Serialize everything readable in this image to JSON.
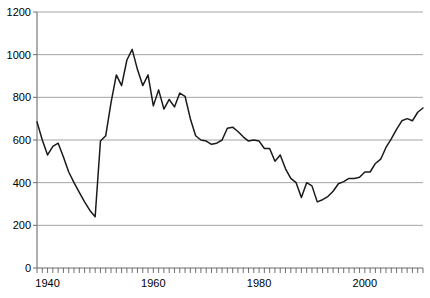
{
  "chart_data": {
    "type": "line",
    "title": "",
    "subtitle": "",
    "xlabel": "",
    "ylabel": "",
    "xlim": [
      1938,
      2011
    ],
    "ylim": [
      0,
      1200
    ],
    "grid": "horizontal",
    "legend": "none",
    "y_ticks": [
      0,
      200,
      400,
      600,
      800,
      1000,
      1200
    ],
    "y_tick_labels": [
      "0",
      "200",
      "400",
      "600",
      "800",
      "1000",
      "1200"
    ],
    "x_tick_labels": [
      "1940",
      "1960",
      "1980",
      "2000"
    ],
    "x_tick_values": [
      1940,
      1960,
      1980,
      2000
    ],
    "x_minor_tick_interval": 1,
    "series": [
      {
        "name": "series-1",
        "color": "#1a1a1a",
        "x": [
          1938,
          1939,
          1940,
          1941,
          1942,
          1943,
          1944,
          1945,
          1946,
          1947,
          1948,
          1949,
          1950,
          1951,
          1952,
          1953,
          1954,
          1955,
          1956,
          1957,
          1958,
          1959,
          1960,
          1961,
          1962,
          1963,
          1964,
          1965,
          1966,
          1967,
          1968,
          1969,
          1970,
          1971,
          1972,
          1973,
          1974,
          1975,
          1976,
          1977,
          1978,
          1979,
          1980,
          1981,
          1982,
          1983,
          1984,
          1985,
          1986,
          1987,
          1988,
          1989,
          1990,
          1991,
          1992,
          1993,
          1994,
          1995,
          1996,
          1997,
          1998,
          1999,
          2000,
          2001,
          2002,
          2003,
          2004,
          2005,
          2006,
          2007,
          2008,
          2009,
          2010,
          2011
        ],
        "values": [
          685,
          600,
          530,
          570,
          585,
          520,
          450,
          400,
          355,
          310,
          270,
          240,
          595,
          620,
          775,
          905,
          855,
          975,
          1025,
          930,
          855,
          905,
          760,
          835,
          745,
          790,
          755,
          820,
          805,
          700,
          620,
          600,
          595,
          580,
          585,
          600,
          655,
          660,
          640,
          615,
          595,
          600,
          595,
          560,
          560,
          500,
          530,
          465,
          420,
          400,
          330,
          400,
          385,
          310,
          320,
          335,
          360,
          395,
          405,
          420,
          420,
          425,
          450,
          450,
          490,
          510,
          565,
          605,
          650,
          690,
          700,
          690,
          730,
          750
        ]
      }
    ]
  }
}
